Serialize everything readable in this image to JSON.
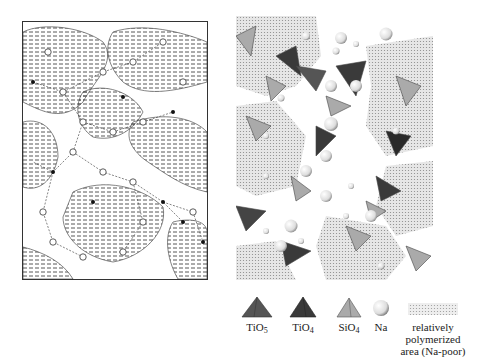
{
  "figure": {
    "left_panel": {
      "description": "network model with hatched polymerized regions, open circles and black dots connected by lines"
    },
    "right_panel": {
      "description": "polyhedral model with tetrahedra and Na spheres"
    }
  },
  "legend": {
    "items": [
      {
        "label": "TiO",
        "sub": "5",
        "color": "#555555"
      },
      {
        "label": "TiO",
        "sub": "4",
        "color": "#444444"
      },
      {
        "label": "SiO",
        "sub": "4",
        "color": "#aaaaaa"
      },
      {
        "label": "Na",
        "sub": "",
        "color": "#dddddd"
      },
      {
        "label": "relatively polymerized",
        "label2": "area (Na-poor)",
        "sub": "",
        "color": "#cccccc"
      }
    ]
  },
  "colors": {
    "tio5": "#555555",
    "tio4": "#3a3a3a",
    "sio4": "#a8a8a8",
    "polymerized": "#d6d6d6",
    "line": "#333333"
  }
}
